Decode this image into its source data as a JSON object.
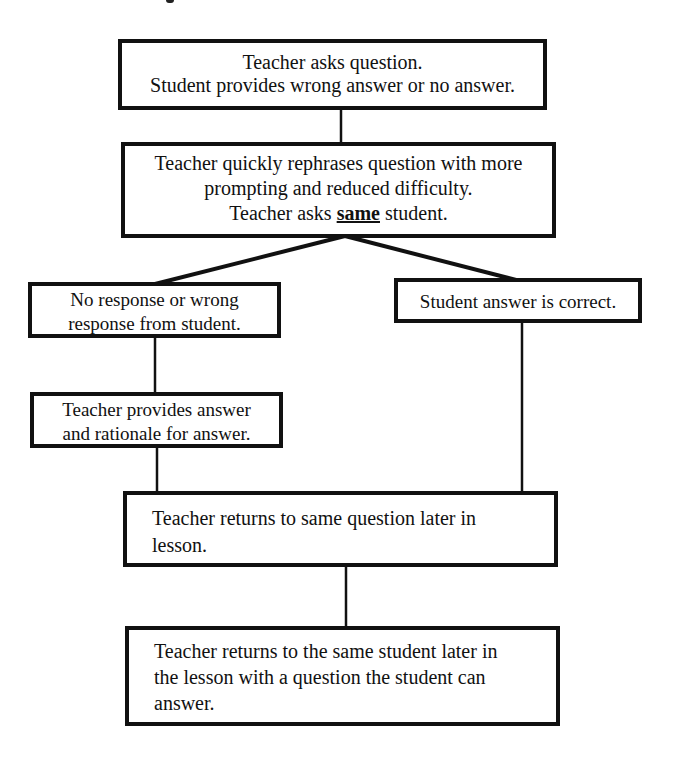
{
  "diagram": {
    "type": "flowchart",
    "nodes": [
      {
        "id": "ask",
        "lines": [
          "Teacher asks question.",
          "Student provides wrong answer or no answer."
        ]
      },
      {
        "id": "rephrase",
        "lines": [
          "Teacher quickly rephrases question with more",
          "prompting and reduced difficulty."
        ],
        "line3_pre": "Teacher asks ",
        "line3_emph": "same",
        "line3_post": " student."
      },
      {
        "id": "wrong",
        "lines": [
          "No response or wrong",
          "response from student."
        ]
      },
      {
        "id": "correct",
        "lines": [
          "Student answer is correct."
        ]
      },
      {
        "id": "provide",
        "lines": [
          "Teacher provides answer",
          "and rationale for answer."
        ]
      },
      {
        "id": "return_q",
        "lines": [
          "Teacher returns to same question later in",
          "lesson."
        ]
      },
      {
        "id": "return_s",
        "lines": [
          "Teacher returns to the same student later in",
          "the lesson with a question the student can",
          "answer."
        ]
      }
    ],
    "edges": [
      [
        "ask",
        "rephrase"
      ],
      [
        "rephrase",
        "wrong"
      ],
      [
        "rephrase",
        "correct"
      ],
      [
        "wrong",
        "provide"
      ],
      [
        "provide",
        "return_q"
      ],
      [
        "correct",
        "return_q"
      ],
      [
        "return_q",
        "return_s"
      ]
    ],
    "colors": {
      "stroke": "#111111",
      "background": "#ffffff"
    }
  }
}
